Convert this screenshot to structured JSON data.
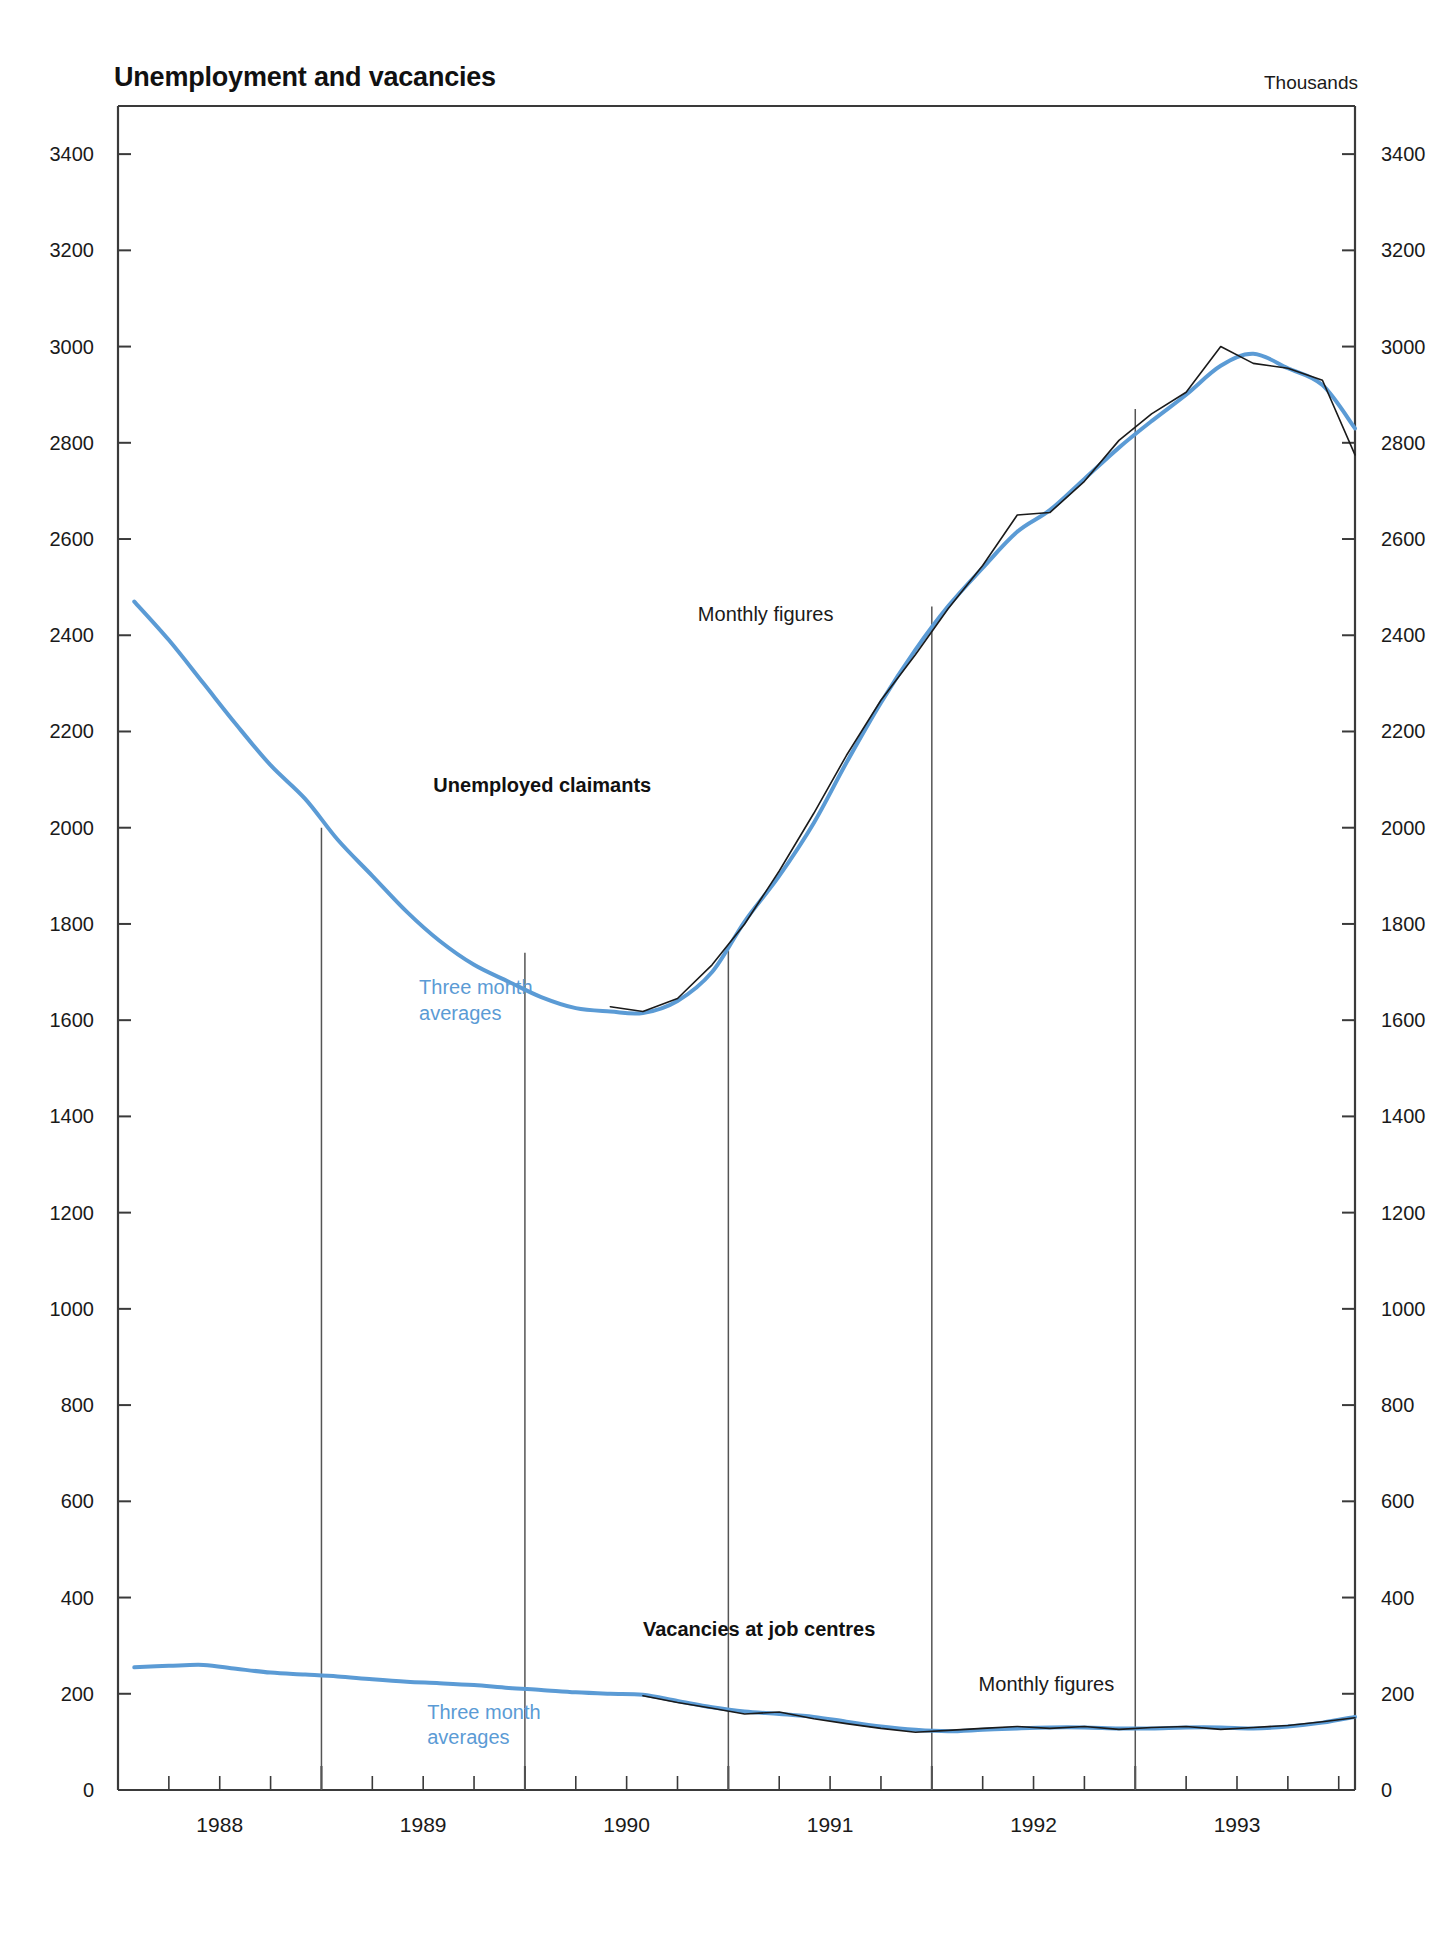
{
  "figure": {
    "title": "Unemployment and vacancies",
    "units": "Thousands",
    "background": "#ffffff"
  },
  "colors": {
    "monthly_line": "#1a1a1a",
    "three_month_line": "#5b9bd5",
    "axis": "#3a3a3a",
    "text": "#1a1a1a"
  },
  "annotations": {
    "claimants_series": "Unemployed claimants",
    "claimants_monthly": "Monthly figures",
    "claimants_avg_line1": "Three month",
    "claimants_avg_line2": "averages",
    "vacancies_series": "Vacancies at job centres",
    "vacancies_monthly": "Monthly figures",
    "vacancies_avg_line1": "Three month",
    "vacancies_avg_line2": "averages"
  },
  "chart_data": {
    "type": "line",
    "title": "Unemployment and vacancies",
    "subtitle": "",
    "xlabel": "",
    "ylabel": "Thousands",
    "ylim": [
      0,
      3500
    ],
    "xlim": [
      1987.5,
      1993.58
    ],
    "grid": false,
    "legend_position": "inline-annotations",
    "yticks": [
      0,
      200,
      400,
      600,
      800,
      1000,
      1200,
      1400,
      1600,
      1800,
      2000,
      2200,
      2400,
      2600,
      2800,
      3000,
      3200,
      3400
    ],
    "ytick_labels": [
      "0",
      "200",
      "400",
      "600",
      "800",
      "1000",
      "1200",
      "1400",
      "1600",
      "1800",
      "2000",
      "2200",
      "2400",
      "2600",
      "2800",
      "3000",
      "3200",
      "3400"
    ],
    "y_axis_both_sides": true,
    "xticks_major": [
      1988.5,
      1989.5,
      1990.5,
      1991.5,
      1992.5
    ],
    "xtick_labels": [
      "1988",
      "1989",
      "1990",
      "1991",
      "1992",
      "1993"
    ],
    "xtick_label_positions": [
      1988.0,
      1989.0,
      1990.0,
      1991.0,
      1992.0,
      1993.0
    ],
    "xticks_minor_step": 0.25,
    "series": [
      {
        "name": "Unemployed claimants - Three month averages",
        "color": "#5b9bd5",
        "style": "solid",
        "width": 4,
        "x": [
          1987.58,
          1987.75,
          1987.92,
          1988.08,
          1988.25,
          1988.42,
          1988.58,
          1988.75,
          1988.92,
          1989.08,
          1989.25,
          1989.42,
          1989.58,
          1989.75,
          1989.92,
          1990.08,
          1990.25,
          1990.42,
          1990.58,
          1990.75,
          1990.92,
          1991.08,
          1991.25,
          1991.42,
          1991.58,
          1991.75,
          1991.92,
          1992.08,
          1992.25,
          1992.42,
          1992.58,
          1992.75,
          1992.92,
          1993.08,
          1993.25,
          1993.42,
          1993.58
        ],
        "y": [
          2470,
          2390,
          2300,
          2215,
          2130,
          2060,
          1975,
          1900,
          1825,
          1765,
          1715,
          1680,
          1648,
          1625,
          1618,
          1615,
          1640,
          1700,
          1805,
          1900,
          2010,
          2135,
          2260,
          2370,
          2460,
          2540,
          2615,
          2660,
          2725,
          2790,
          2845,
          2900,
          2960,
          2985,
          2955,
          2920,
          2830
        ]
      },
      {
        "name": "Unemployed claimants - Monthly figures",
        "color": "#1a1a1a",
        "style": "solid",
        "width": 1.6,
        "x": [
          1989.92,
          1990.08,
          1990.25,
          1990.42,
          1990.58,
          1990.75,
          1990.92,
          1991.08,
          1991.25,
          1991.42,
          1991.58,
          1991.75,
          1991.92,
          1992.08,
          1992.25,
          1992.42,
          1992.58,
          1992.75,
          1992.92,
          1993.08,
          1993.25,
          1993.42,
          1993.58
        ],
        "y": [
          1628,
          1618,
          1645,
          1715,
          1800,
          1910,
          2030,
          2150,
          2265,
          2360,
          2455,
          2545,
          2650,
          2655,
          2720,
          2805,
          2860,
          2905,
          3000,
          2965,
          2955,
          2930,
          2775
        ]
      },
      {
        "name": "Vacancies at job centres - Three month averages",
        "color": "#5b9bd5",
        "style": "solid",
        "width": 4,
        "x": [
          1987.58,
          1987.75,
          1987.92,
          1988.08,
          1988.25,
          1988.42,
          1988.58,
          1988.75,
          1988.92,
          1989.08,
          1989.25,
          1989.42,
          1989.58,
          1989.75,
          1989.92,
          1990.08,
          1990.25,
          1990.42,
          1990.58,
          1990.75,
          1990.92,
          1991.08,
          1991.25,
          1991.42,
          1991.58,
          1991.75,
          1991.92,
          1992.08,
          1992.25,
          1992.42,
          1992.58,
          1992.75,
          1992.92,
          1993.08,
          1993.25,
          1993.42,
          1993.58
        ],
        "y": [
          255,
          258,
          260,
          252,
          244,
          240,
          236,
          230,
          225,
          222,
          218,
          212,
          208,
          203,
          200,
          198,
          185,
          172,
          163,
          158,
          152,
          142,
          132,
          125,
          122,
          125,
          128,
          130,
          130,
          128,
          128,
          130,
          130,
          128,
          132,
          140,
          152
        ]
      },
      {
        "name": "Vacancies at job centres - Monthly figures",
        "color": "#1a1a1a",
        "style": "solid",
        "width": 1.6,
        "x": [
          1990.08,
          1990.25,
          1990.42,
          1990.58,
          1990.75,
          1990.92,
          1991.08,
          1991.25,
          1991.42,
          1991.58,
          1991.75,
          1991.92,
          1992.08,
          1992.25,
          1992.42,
          1992.58,
          1992.75,
          1992.92,
          1993.08,
          1993.25,
          1993.42,
          1993.58
        ],
        "y": [
          196,
          182,
          170,
          158,
          162,
          148,
          138,
          128,
          120,
          124,
          128,
          132,
          128,
          132,
          126,
          130,
          132,
          126,
          130,
          134,
          142,
          150
        ]
      }
    ],
    "separators": [
      1988.5,
      1989.5,
      1990.5,
      1991.5,
      1992.5
    ]
  }
}
